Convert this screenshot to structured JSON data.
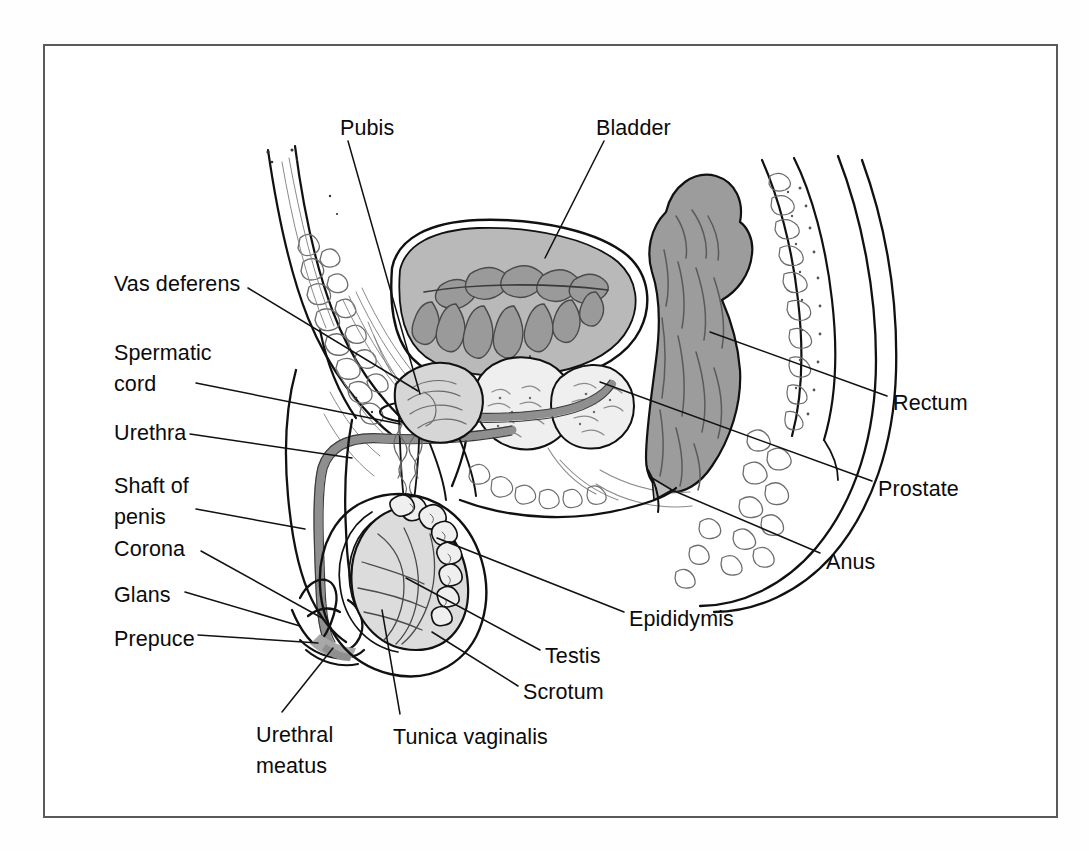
{
  "figure": {
    "kind": "anatomical-line-diagram",
    "frame": {
      "border_color": "#5a5a5a",
      "background": "#ffffff"
    },
    "palette": {
      "ink": "#111111",
      "hatch": "#555555",
      "bladder_fill": "#b9b9b9",
      "bladder_inner_fill": "#9a9a9a",
      "prostate_fill": "#c4c4c4",
      "rectum_fill": "#9c9c9c",
      "urethra_gray": "#8f8f8f",
      "testis_fill": "#dcdcdc",
      "tissue_light": "#efefef",
      "paper": "#ffffff"
    }
  },
  "labels": [
    {
      "id": "pubis",
      "text": "Pubis",
      "x": 340,
      "y": 113,
      "align": "left"
    },
    {
      "id": "bladder",
      "text": "Bladder",
      "x": 596,
      "y": 113,
      "align": "left"
    },
    {
      "id": "vas-deferens",
      "text": "Vas deferens",
      "x": 114,
      "y": 269,
      "align": "left"
    },
    {
      "id": "spermatic-cord",
      "text": "Spermatic\ncord",
      "x": 114,
      "y": 338,
      "align": "left"
    },
    {
      "id": "urethra",
      "text": "Urethra",
      "x": 114,
      "y": 418,
      "align": "left"
    },
    {
      "id": "shaft-of-penis",
      "text": "Shaft of\npenis",
      "x": 114,
      "y": 471,
      "align": "left"
    },
    {
      "id": "corona",
      "text": "Corona",
      "x": 114,
      "y": 534,
      "align": "left"
    },
    {
      "id": "glans",
      "text": "Glans",
      "x": 114,
      "y": 580,
      "align": "left"
    },
    {
      "id": "prepuce",
      "text": "Prepuce",
      "x": 114,
      "y": 624,
      "align": "left"
    },
    {
      "id": "urethral-meatus",
      "text": "Urethral\nmeatus",
      "x": 256,
      "y": 720,
      "align": "left"
    },
    {
      "id": "tunica-vaginalis",
      "text": "Tunica vaginalis",
      "x": 393,
      "y": 722,
      "align": "left"
    },
    {
      "id": "scrotum",
      "text": "Scrotum",
      "x": 523,
      "y": 677,
      "align": "left"
    },
    {
      "id": "testis",
      "text": "Testis",
      "x": 545,
      "y": 641,
      "align": "left"
    },
    {
      "id": "epididymis",
      "text": "Epididymis",
      "x": 629,
      "y": 604,
      "align": "left"
    },
    {
      "id": "anus",
      "text": "Anus",
      "x": 826,
      "y": 547,
      "align": "left"
    },
    {
      "id": "prostate",
      "text": "Prostate",
      "x": 878,
      "y": 474,
      "align": "left"
    },
    {
      "id": "rectum",
      "text": "Rectum",
      "x": 893,
      "y": 388,
      "align": "left"
    }
  ],
  "leader_lines": [
    {
      "for": "pubis",
      "d": "M 348 141 L 420 394"
    },
    {
      "for": "bladder",
      "d": "M 604 141 L 545 258"
    },
    {
      "for": "vas-deferens",
      "d": "M 248 288 L 418 391"
    },
    {
      "for": "spermatic-cord",
      "d": "M 196 383 L 400 424"
    },
    {
      "for": "urethra",
      "d": "M 190 434 L 352 458"
    },
    {
      "for": "shaft-of-penis",
      "d": "M 196 509 L 305 529"
    },
    {
      "for": "corona",
      "d": "M 201 551 L 322 618"
    },
    {
      "for": "glans",
      "d": "M 185 592 L 300 626"
    },
    {
      "for": "prepuce",
      "d": "M 198 635 L 318 643"
    },
    {
      "for": "urethral-meatus",
      "d": "M 282 712 L 333 648"
    },
    {
      "for": "tunica-vaginalis",
      "d": "M 400 714 L 382 610"
    },
    {
      "for": "scrotum",
      "d": "M 518 686 L 432 632"
    },
    {
      "for": "testis",
      "d": "M 540 650 L 406 578"
    },
    {
      "for": "epididymis",
      "d": "M 624 612 L 437 538"
    },
    {
      "for": "anus",
      "d": "M 820 553 L 672 490"
    },
    {
      "for": "prostate",
      "d": "M 872 481 L 600 382"
    },
    {
      "for": "rectum",
      "d": "M 887 396 L 710 332"
    }
  ]
}
